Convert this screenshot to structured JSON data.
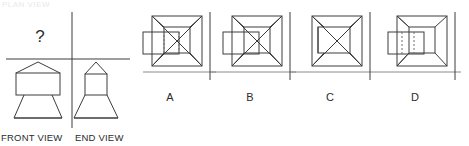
{
  "page": {
    "kind": "orthographic-projection-multiple-choice",
    "background_color": "#ffffff",
    "line_color": "#3c3c3c",
    "dashed_color": "#6e6e6e",
    "text_color": "#2b2b2b",
    "width": 469,
    "height": 146
  },
  "question": {
    "missing_view_marker": "?",
    "front_view_label": "FRONT VIEW",
    "end_view_label": "END VIEW"
  },
  "options": [
    {
      "id": "A",
      "label": "A",
      "hidden_edges": "dashed",
      "side_box": "left-protrusion"
    },
    {
      "id": "B",
      "label": "B",
      "hidden_edges": "solid",
      "side_box": "left-protrusion"
    },
    {
      "id": "C",
      "label": "C",
      "hidden_edges": "none",
      "side_box": "none"
    },
    {
      "id": "D",
      "label": "D",
      "hidden_edges": "dashed",
      "side_box": "left-protrusion"
    }
  ],
  "ghost_header": "PLAN VIEW"
}
